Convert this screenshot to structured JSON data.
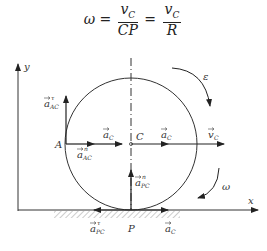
{
  "formula": {
    "lhs": "ω",
    "eq": "=",
    "frac1_num": "v",
    "frac1_num_sub": "C",
    "frac1_den": "CP",
    "frac2_num": "v",
    "frac2_num_sub": "C",
    "frac2_den": "R"
  },
  "labels": {
    "y_axis": "y",
    "x_axis": "x",
    "point_A": "A",
    "point_C": "C",
    "point_P": "P",
    "a_AC_tau": "a",
    "a_AC_tau_sub": "AC",
    "a_AC_tau_sup": "τ",
    "a_AC_n": "a",
    "a_AC_n_sub": "AC",
    "a_AC_n_sup": "n",
    "a_C_left": "a",
    "a_C_left_sub": "C",
    "a_C_right": "a",
    "a_C_right_sub": "C",
    "v_C": "v",
    "v_C_sub": "C",
    "a_PC_n": "a",
    "a_PC_n_sub": "PC",
    "a_PC_n_sup": "n",
    "a_PC_tau": "a",
    "a_PC_tau_sub": "PC",
    "a_PC_tau_sup": "τ",
    "a_C_bottom": "a",
    "a_C_bottom_sub": "C",
    "epsilon": "ε",
    "omega": "ω"
  }
}
